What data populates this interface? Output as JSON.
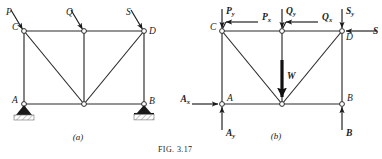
{
  "figure": {
    "caption": "Fig. 3.17",
    "caption_display": "FIG. 3.17"
  },
  "panels": [
    {
      "id": "a",
      "caption": "(a)",
      "description": "Loaded truss with pin support at A and roller support at B",
      "joints": [
        {
          "name": "C",
          "label": "C",
          "label_side": "left"
        },
        {
          "name": "D",
          "label": "D",
          "label_side": "right"
        },
        {
          "name": "A",
          "label": "A",
          "label_side": "left"
        },
        {
          "name": "B",
          "label": "B",
          "label_side": "right"
        },
        {
          "name": "E",
          "label": "",
          "label_side": "none"
        },
        {
          "name": "F",
          "label": "",
          "label_side": "none"
        }
      ],
      "loads": [
        {
          "name": "P",
          "label": "P",
          "at": "C",
          "direction": "inclined-down-right"
        },
        {
          "name": "Q",
          "label": "Q",
          "at": "E",
          "direction": "inclined-down-right"
        },
        {
          "name": "S",
          "label": "S",
          "at": "D",
          "direction": "inclined-down-right"
        }
      ],
      "supports": [
        {
          "at": "A",
          "type": "pin"
        },
        {
          "at": "B",
          "type": "roller"
        }
      ]
    },
    {
      "id": "b",
      "caption": "(b)",
      "description": "Free-body diagram with resolved force components and reactions",
      "joints": [
        {
          "name": "C",
          "label": "C",
          "label_side": "left"
        },
        {
          "name": "D",
          "label": "D",
          "label_side": "right"
        },
        {
          "name": "A",
          "label": "A",
          "label_side": "right"
        },
        {
          "name": "B",
          "label": "B",
          "label_side": "right"
        },
        {
          "name": "E",
          "label": "",
          "label_side": "none"
        },
        {
          "name": "F",
          "label": "",
          "label_side": "none"
        }
      ],
      "forces": [
        {
          "name": "Py",
          "base": "P",
          "sub": "y",
          "at": "C",
          "direction": "down"
        },
        {
          "name": "Px",
          "base": "P",
          "sub": "x",
          "at": "C",
          "direction": "left"
        },
        {
          "name": "Qy",
          "base": "Q",
          "sub": "y",
          "at": "E",
          "direction": "down"
        },
        {
          "name": "Qx",
          "base": "Q",
          "sub": "x",
          "at": "E",
          "direction": "left"
        },
        {
          "name": "Sy",
          "base": "S",
          "sub": "y",
          "at": "D",
          "direction": "down"
        },
        {
          "name": "S",
          "base": "S",
          "sub": "",
          "at": "D",
          "direction": "left"
        },
        {
          "name": "W",
          "base": "W",
          "sub": "",
          "at": "F",
          "direction": "down"
        },
        {
          "name": "Ax",
          "base": "A",
          "sub": "x",
          "at": "A",
          "direction": "right"
        },
        {
          "name": "Ay",
          "base": "A",
          "sub": "y",
          "at": "A",
          "direction": "up"
        },
        {
          "name": "B",
          "base": "B",
          "sub": "",
          "at": "B",
          "direction": "up"
        }
      ]
    }
  ],
  "colors": {
    "ink": "#1a1a1a",
    "member": "#2b2b2b",
    "background": "#ffffff",
    "hatch": "#6d6d6d"
  }
}
